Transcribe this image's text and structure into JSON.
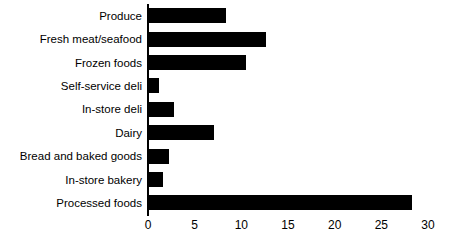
{
  "chart_data": {
    "type": "bar",
    "orientation": "horizontal",
    "title": "",
    "subtitle": "",
    "xlabel": "",
    "ylabel": "",
    "categories": [
      "Produce",
      "Fresh meat/seafood",
      "Frozen foods",
      "Self-service deli",
      "In-store deli",
      "Dairy",
      "Bread and baked goods",
      "In-store bakery",
      "Processed foods"
    ],
    "values": [
      8.4,
      12.6,
      10.5,
      1.2,
      2.8,
      7.1,
      2.3,
      1.6,
      28.3
    ],
    "xlim": [
      0,
      30
    ],
    "xticks": [
      0,
      5,
      10,
      15,
      20,
      25,
      30
    ],
    "xticklabels": [
      "0",
      "5",
      "10",
      "15",
      "20",
      "25",
      "30"
    ],
    "grid": false,
    "legend": false,
    "legend_position": "none",
    "bar_color": "#000000",
    "background_color": "#ffffff",
    "axis_color": "#000000"
  }
}
